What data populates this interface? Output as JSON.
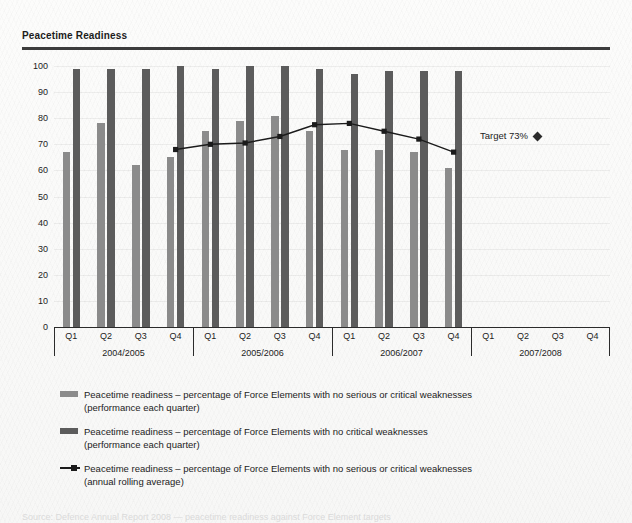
{
  "header": {
    "title": "Peacetime Readiness"
  },
  "target": {
    "label": "Target 73%",
    "value": 73,
    "marker": "diamond-marker"
  },
  "legend": [
    {
      "swatch": "light",
      "text": "Peacetime readiness – percentage of Force Elements with no serious or critical weaknesses",
      "sub": "(performance each quarter)"
    },
    {
      "swatch": "dark",
      "text": "Peacetime readiness – percentage of Force Elements with no critical weaknesses",
      "sub": "(performance each quarter)"
    },
    {
      "swatch": "line",
      "text": "Peacetime readiness – percentage of Force Elements with no serious or critical weaknesses",
      "sub": "(annual rolling average)"
    }
  ],
  "footnote": {
    "text": "Source: Defence Annual Report 2008 — peacetime readiness against Force Element targets"
  },
  "chart_data": {
    "type": "bar",
    "title": "Peacetime Readiness",
    "xlabel": "",
    "ylabel": "",
    "ylim": [
      0,
      100
    ],
    "yticks": [
      0,
      10,
      20,
      30,
      40,
      50,
      60,
      70,
      80,
      90,
      100
    ],
    "grid": true,
    "legend_position": "below",
    "categories": [
      "Q1",
      "Q2",
      "Q3",
      "Q4",
      "Q1",
      "Q2",
      "Q3",
      "Q4",
      "Q1",
      "Q2",
      "Q3",
      "Q4",
      "Q1",
      "Q2",
      "Q3",
      "Q4"
    ],
    "year_groups": [
      {
        "label": "2004/2005",
        "quarters": [
          "Q1",
          "Q2",
          "Q3",
          "Q4"
        ]
      },
      {
        "label": "2005/2006",
        "quarters": [
          "Q1",
          "Q2",
          "Q3",
          "Q4"
        ]
      },
      {
        "label": "2006/2007",
        "quarters": [
          "Q1",
          "Q2",
          "Q3",
          "Q4"
        ]
      },
      {
        "label": "2007/2008",
        "quarters": [
          "Q1",
          "Q2",
          "Q3",
          "Q4"
        ]
      }
    ],
    "series": [
      {
        "name": "Peacetime readiness – percentage of Force Elements with no serious or critical weaknesses (performance each quarter)",
        "type": "bar",
        "color": "#8b8b8b",
        "values": [
          67,
          78,
          62,
          65,
          75,
          79,
          81,
          75,
          68,
          68,
          67,
          61,
          null,
          null,
          null,
          null
        ]
      },
      {
        "name": "Peacetime readiness – percentage of Force Elements with no critical weaknesses (performance each quarter)",
        "type": "bar",
        "color": "#5c5c5c",
        "values": [
          99,
          99,
          99,
          100,
          99,
          100,
          100,
          99,
          97,
          98,
          98,
          98,
          null,
          null,
          null,
          null
        ]
      },
      {
        "name": "Peacetime readiness – percentage of Force Elements with no serious or critical weaknesses (annual rolling average)",
        "type": "line",
        "color": "#1b1b1b",
        "values": [
          null,
          null,
          null,
          68,
          70,
          70.5,
          73,
          77.5,
          78,
          75,
          72,
          67,
          null,
          null,
          null,
          null
        ]
      }
    ],
    "annotations": [
      {
        "label": "Target 73%",
        "value": 73,
        "marker": "diamond"
      }
    ]
  }
}
